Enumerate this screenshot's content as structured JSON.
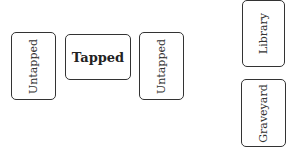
{
  "battlefield": {
    "cards": [
      {
        "label": "Untapped",
        "state": "untapped"
      },
      {
        "label": "Tapped",
        "state": "tapped"
      },
      {
        "label": "Untapped",
        "state": "untapped"
      }
    ]
  },
  "zones": {
    "library": {
      "label": "Library"
    },
    "graveyard": {
      "label": "Graveyard"
    }
  }
}
